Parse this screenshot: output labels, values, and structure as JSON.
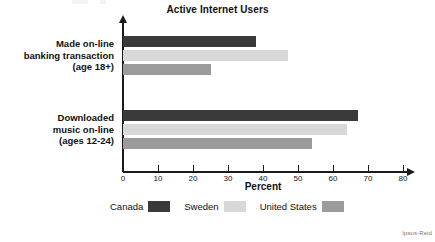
{
  "chart_data": {
    "type": "bar",
    "orientation": "horizontal",
    "title": "Active Internet Users",
    "xlabel": "Percent",
    "ylabel": "",
    "xlim": [
      0,
      80
    ],
    "xticks": [
      0,
      10,
      20,
      30,
      40,
      50,
      60,
      70,
      80
    ],
    "xtick_labels": [
      "0",
      "10",
      "20",
      "30",
      "40",
      "50",
      "60",
      "70",
      "80"
    ],
    "grid": false,
    "legend_position": "bottom",
    "categories": [
      "Made on-line banking transaction (age 18+)",
      "Downloaded music on-line (ages 12-24)"
    ],
    "category_lines": [
      [
        "Made on-line",
        "banking transaction",
        "(age 18+)"
      ],
      [
        "Downloaded",
        "music on-line",
        "(ages 12-24)"
      ]
    ],
    "series": [
      {
        "name": "Canada",
        "color": "#3a3a3a",
        "values": [
          38,
          67
        ]
      },
      {
        "name": "Sweden",
        "color": "#d8d8d8",
        "values": [
          47,
          64
        ]
      },
      {
        "name": "United States",
        "color": "#9b9b9b",
        "values": [
          25,
          54
        ]
      }
    ],
    "source": "Ipsos-Reid"
  },
  "legend": {
    "entries": [
      {
        "label": "Canada"
      },
      {
        "label": "Sweden"
      },
      {
        "label": "United States"
      }
    ]
  }
}
